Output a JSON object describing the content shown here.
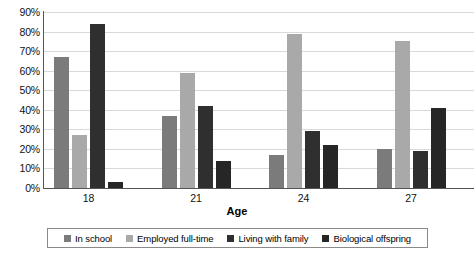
{
  "chart_data": {
    "type": "bar",
    "title": "",
    "xlabel": "Age",
    "ylabel": "",
    "categories": [
      "18",
      "21",
      "24",
      "27"
    ],
    "series": [
      {
        "name": "In school",
        "color": "#7b7b7b",
        "values": [
          67,
          37,
          17,
          20
        ]
      },
      {
        "name": "Employed full-time",
        "color": "#a9a9a9",
        "values": [
          27,
          59,
          79,
          75
        ]
      },
      {
        "name": "Living with family",
        "color": "#2f2f2f",
        "values": [
          84,
          42,
          29,
          19
        ]
      },
      {
        "name": "Biological offspring",
        "color": "#262626",
        "values": [
          3,
          14,
          22,
          41
        ]
      }
    ],
    "ylim": [
      0,
      90
    ],
    "yticks": [
      "0%",
      "10%",
      "20%",
      "30%",
      "40%",
      "50%",
      "60%",
      "70%",
      "80%",
      "90%"
    ],
    "ytick_values": [
      0,
      10,
      20,
      30,
      40,
      50,
      60,
      70,
      80,
      90
    ],
    "grid": true,
    "grid_axis": "y",
    "legend_position": "bottom",
    "bar_group_labels": [
      "18",
      "21",
      "24",
      "27"
    ]
  },
  "axis": {
    "x_title": "Age"
  },
  "colors": {
    "grid": "#d9d9d9",
    "axis": "#555555",
    "text": "#111111",
    "background": "#ffffff",
    "legend_border": "#8a8a8a"
  }
}
